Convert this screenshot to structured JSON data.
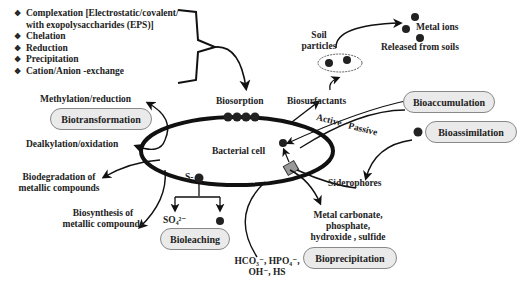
{
  "mechanisms_list": {
    "bullet_glyph": "❖",
    "items": [
      {
        "line1": "Complexation [Electrostatic/covalent/",
        "line2": "with exopolysaccharides (EPS)]"
      },
      {
        "line1": "Chelation"
      },
      {
        "line1": "Reduction"
      },
      {
        "line1": "Precipitation"
      },
      {
        "line1": "Cation/Anion -exchange"
      }
    ]
  },
  "center": {
    "label": "Bacterial cell"
  },
  "biosorption": {
    "label": "Biosorption"
  },
  "soil": {
    "particles_label_1": "Soil",
    "particles_label_2": "particles",
    "metal_ions": "Metal ions",
    "released": "Released from soils",
    "biosurfactants": "Biosurfactants"
  },
  "transport": {
    "active": "Active",
    "passive": "Passive"
  },
  "boxes": {
    "biotransformation": "Biotransformation",
    "bioaccumulation": "Bioaccumulation",
    "bioassimilation": "Bioassimilation",
    "bioleaching": "Bioleaching",
    "bioprecipitation": "Bioprecipitation"
  },
  "biotransformation_items": {
    "methylation": "Methylation/reduction",
    "dealkylation": "Dealkylation/oxidation",
    "biodegradation_1": "Biodegradation of",
    "biodegradation_2": "metallic compounds",
    "biosynthesis_1": "Biosynthesis of",
    "biosynthesis_2": "metallic compounds"
  },
  "bioleaching_items": {
    "s_label": "S-",
    "sulfate": "SO₄²⁻"
  },
  "siderophores": {
    "label": "Siderophores"
  },
  "precipitation_items": {
    "line1": "Metal carbonate,",
    "line2": "phosphate,",
    "line3": "hydroxide , sulfide",
    "anions_1": "HCO₃⁻, HPO₄⁻,",
    "anions_2": "OH⁻, HS"
  },
  "colors": {
    "ink": "#111111",
    "pill_fill": "#eaeaea",
    "pill_border": "#888888"
  }
}
